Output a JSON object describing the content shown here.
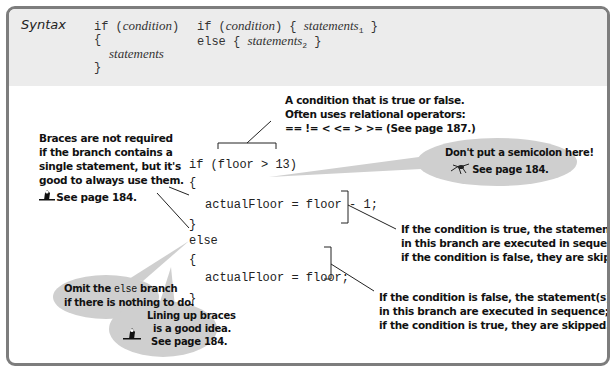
{
  "syntax": {
    "label": "Syntax",
    "form1": {
      "line1_kw": "if (",
      "line1_cond": "condition",
      "line1_close": ")",
      "open_brace": "{",
      "body": "statements",
      "close_brace": "}"
    },
    "form2": {
      "line1_kw": "if (",
      "line1_cond": "condition",
      "line1_mid": ") { ",
      "line1_stmt": "statements",
      "line1_sub": "1",
      "line1_end": " }",
      "line2_kw": "else { ",
      "line2_stmt": "statements",
      "line2_sub": "2",
      "line2_end": " }"
    }
  },
  "code": {
    "lines": [
      "if (floor > 13)",
      "{",
      "   actualFloor = floor - 1;",
      "}",
      "else",
      "{",
      "   actualFloor = floor;",
      "}"
    ]
  },
  "annotations": {
    "condition": [
      "A condition that is true or false.",
      "Often uses relational operators:",
      "== != < <= > >= (See page 187.)"
    ],
    "braces": [
      "Braces are not required",
      "if the branch contains a",
      "single statement, but it's",
      "good to always use them."
    ],
    "braces_ref": "See page 184.",
    "semicolon": {
      "line1": "Don't put a semicolon here!",
      "line2": "See page 184."
    },
    "true_branch": [
      "If the condition is true, the statement(s)",
      "in this branch are executed in sequence;",
      "if the condition is false, they are skipped."
    ],
    "false_branch": [
      "If the condition is false, the statement(s)",
      "in this branch are executed in sequence;",
      "if the condition is true, they are skipped."
    ],
    "omit_else": {
      "pre": "Omit the ",
      "kw": "else",
      "post": " branch",
      "line2": "if there is nothing to do."
    },
    "lining_up": [
      "Lining up braces",
      "is a good idea.",
      "See page 184."
    ]
  },
  "icons": {
    "tip": "tip-icon",
    "spider": "bug-icon"
  },
  "colors": {
    "frame_border": "#7d7d7d",
    "syntax_band": "#ececec",
    "bubble": "#cfcfcf",
    "text": "#111111"
  }
}
